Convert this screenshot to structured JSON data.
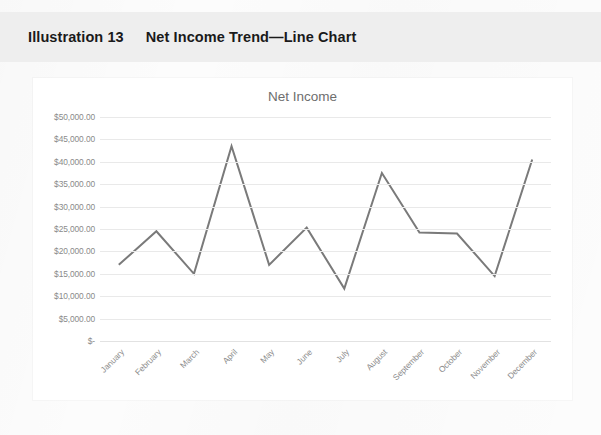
{
  "caption": {
    "number": "Illustration 13",
    "title": "Net Income Trend—Line Chart"
  },
  "chart_data": {
    "type": "line",
    "title": "Net Income",
    "xlabel": "",
    "ylabel": "",
    "categories": [
      "January",
      "February",
      "March",
      "April",
      "May",
      "June",
      "July",
      "August",
      "September",
      "October",
      "November",
      "December"
    ],
    "series": [
      {
        "name": "Net Income",
        "values": [
          17000,
          24500,
          15000,
          43500,
          17000,
          25300,
          11700,
          37500,
          24200,
          24000,
          14500,
          40500
        ],
        "color": "#7a7a7a"
      }
    ],
    "ylim": [
      0,
      50000
    ],
    "ytick_values": [
      50000,
      45000,
      40000,
      35000,
      30000,
      25000,
      20000,
      15000,
      10000,
      5000,
      0
    ],
    "ytick_labels": [
      "$50,000.00",
      "$45,000.00",
      "$40,000.00",
      "$35,000.00",
      "$30,000.00",
      "$25,000.00",
      "$20,000.00",
      "$15,000.00",
      "$10,000.00",
      "$5,000.00",
      "$-"
    ],
    "grid": true,
    "grid_axis": "y",
    "legend": false,
    "legend_position": "none",
    "markers": false,
    "line_width": 2
  },
  "colors": {
    "caption_band": "#eeeeee",
    "caption_text": "#1a1a1a",
    "card_background": "#ffffff",
    "page_background": "#fcfcfc",
    "gridline": "#e9e9e9",
    "axis_text": "#8a8a8a",
    "chart_title_text": "#6e6e6e",
    "series_line": "#7a7a7a"
  }
}
